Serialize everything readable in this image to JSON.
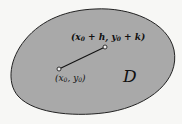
{
  "diagram": {
    "region": {
      "label": "D",
      "fill": "#a9a9a9",
      "stroke": "#222222"
    },
    "segment": {
      "start": {
        "label_var_x": "x",
        "label_var_y": "y",
        "subscript": "0",
        "full_label": "(x0, y0)"
      },
      "end": {
        "label_var_x": "x",
        "label_var_y": "y",
        "subscript": "0",
        "increment_x": "h",
        "increment_y": "k",
        "full_label": "(x0 + h, y0 + k)"
      }
    },
    "text": {
      "open_paren": "(",
      "close_paren": ")",
      "comma": ", ",
      "plus": " + "
    }
  }
}
